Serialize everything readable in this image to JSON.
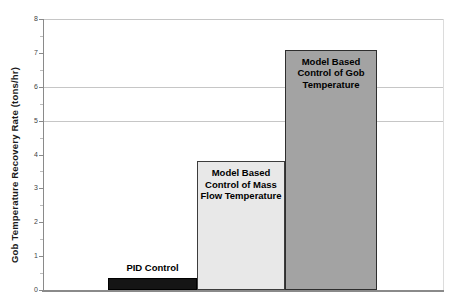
{
  "chart": {
    "ylabel": "Gob Temperature Recovery Rate (tons/hr)",
    "ymin": 0,
    "ymax": 8,
    "tick_step": 1,
    "minor_tick_step": 0.5,
    "tick_labels": [
      "0",
      "1",
      "2",
      "3",
      "4",
      "5",
      "6",
      "7",
      "8"
    ],
    "gridline_values": [
      5,
      6,
      8
    ],
    "bars": [
      {
        "label": "PID Control",
        "label_lines": [
          "PID Control"
        ],
        "label_position": "above",
        "value": 0.35,
        "fill": "#151515",
        "border": "#000000"
      },
      {
        "label": "Model Based Control of Mass Flow Temperature",
        "label_lines": [
          "Model Based",
          "Control of Mass",
          "Flow Temperature"
        ],
        "label_position": "inside",
        "value": 3.8,
        "fill": "#e8e8e8",
        "border": "#3c3c3c"
      },
      {
        "label": "Model Based Control of Gob Temperature",
        "label_lines": [
          "Model Based",
          "Control of Gob",
          "Temperature"
        ],
        "label_position": "inside",
        "value": 7.1,
        "fill": "#a3a3a3",
        "border": "#2e2e2e"
      }
    ],
    "colors": {
      "axis": "#8a8a8a",
      "gridline": "#c6c6c6",
      "plot_right_border": "#dcdcdc",
      "major_tick": "#8a8a8a",
      "minor_tick": "#bdbdbd",
      "tick_label": "#3f3f3f",
      "bar_label": "#000000",
      "background": "#ffffff"
    }
  },
  "chart_data": {
    "type": "bar",
    "categories": [
      "PID Control",
      "Model Based Control of Mass Flow Temperature",
      "Model Based Control of Gob Temperature"
    ],
    "values": [
      0.35,
      3.8,
      7.1
    ],
    "title": "",
    "xlabel": "",
    "ylabel": "Gob Temperature Recovery Rate (tons/hr)",
    "ylim": [
      0,
      8
    ],
    "grid": "horizontal",
    "gridline_values_visible": [
      5,
      6,
      8
    ],
    "legend": "none",
    "bar_labels_position": [
      "above-bar",
      "inside-top",
      "inside-top"
    ],
    "bar_colors": [
      "#151515",
      "#e8e8e8",
      "#a3a3a3"
    ]
  }
}
